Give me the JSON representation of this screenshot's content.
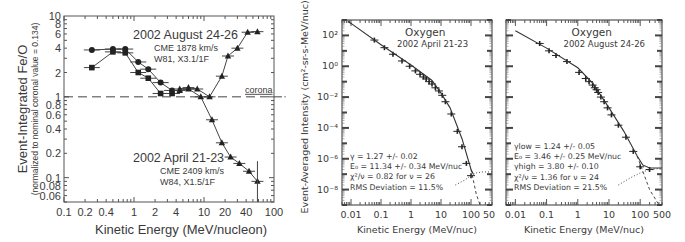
{
  "chart_data": [
    {
      "type": "line",
      "title": "",
      "xlabel": "Kinetic Energy (MeV/nucleon)",
      "ylabel": "Event-Integrated Fe/O",
      "ylabel_sub": "(normalized to nominal coronal value = 0.134)",
      "xscale": "log",
      "yscale": "log",
      "xlim": [
        0.1,
        100
      ],
      "ylim": [
        0.05,
        10
      ],
      "xticks": [
        "0.1",
        "0.2",
        "0.4",
        "1",
        "2",
        "4",
        "10",
        "20",
        "40",
        "100"
      ],
      "xtick_values": [
        0.1,
        0.2,
        0.4,
        1,
        2,
        4,
        10,
        20,
        40,
        100
      ],
      "yticks": [
        "10",
        "8",
        "6",
        "4",
        "2",
        "1",
        "0.8",
        "0.6",
        "0.4",
        "0.2",
        "0.1",
        "0.08",
        "0.06"
      ],
      "ytick_values": [
        10,
        8,
        6,
        4,
        2,
        1,
        0.8,
        0.6,
        0.4,
        0.2,
        0.1,
        0.08,
        0.06
      ],
      "reference_line": {
        "y": 1,
        "label": "corona",
        "style": "dashed"
      },
      "annotations": [
        {
          "title": "2002 August 24-26",
          "lines": [
            "CME 1878 km/s",
            "W81, X3.1/1F"
          ]
        },
        {
          "title": "2002 April 21-23",
          "lines": [
            "CME 2409 km/s",
            "W84, X1.5/1F"
          ]
        }
      ],
      "series": [
        {
          "name": "2002 August 24-26 (circles/squares, low E)",
          "marker": "circle",
          "x": [
            0.25,
            0.5,
            0.75,
            1.15,
            1.6,
            2.4,
            3.5
          ],
          "y": [
            3.8,
            3.9,
            3.9,
            2.7,
            2.2,
            1.5,
            1.2
          ]
        },
        {
          "name": "2002 April 21-23 (squares, low E)",
          "marker": "square",
          "x": [
            0.25,
            0.5,
            0.75,
            1.15,
            1.6,
            2.4,
            3.5
          ],
          "y": [
            2.3,
            3.6,
            3.5,
            2.0,
            1.7,
            1.1,
            1.1
          ]
        },
        {
          "name": "2002 August 24-26 (triangles, high E)",
          "marker": "triangle",
          "x": [
            4.5,
            6,
            8,
            12,
            18,
            22,
            30,
            42,
            58
          ],
          "y": [
            1.25,
            1.3,
            1.25,
            1.0,
            1.8,
            3.2,
            4.0,
            6.3,
            6.4
          ]
        },
        {
          "name": "2002 April 21-23 (triangles, high E)",
          "marker": "triangle",
          "x": [
            4.5,
            6,
            9,
            13,
            18,
            24,
            32,
            44,
            58
          ],
          "y": [
            1.2,
            1.25,
            1.0,
            0.52,
            0.27,
            0.18,
            0.15,
            0.12,
            0.09
          ]
        }
      ]
    },
    {
      "type": "line",
      "title": "Oxygen",
      "subtitle": "2002 April 21-23",
      "xlabel": "Kinetic Energy (MeV/nuc)",
      "ylabel": "Event-Averaged Intensity (cm²-sr-s-MeV/nuc)⁻¹",
      "xscale": "log",
      "yscale": "log",
      "xlim": [
        0.005,
        500
      ],
      "ylim": [
        1e-09,
        1000.0
      ],
      "xticks": [
        "0.01",
        "0.1",
        "1",
        "10",
        "100",
        "500"
      ],
      "xtick_values": [
        0.01,
        0.1,
        1,
        10,
        100,
        500
      ],
      "yticks": [
        "10²",
        "10⁰",
        "10⁻²",
        "10⁻⁴",
        "10⁻⁶",
        "10⁻⁸"
      ],
      "ytick_exps": [
        2,
        0,
        -2,
        -4,
        -6,
        -8
      ],
      "fit_text": [
        "γ = 1.27 +/- 0.02",
        "E₀ = 11.34 +/- 0.34 MeV/nuc",
        "χ²/ν = 0.82 for ν = 26",
        "RMS Deviation = 11.5%"
      ],
      "series": [
        {
          "name": "data",
          "marker": "plus",
          "x": [
            0.06,
            0.13,
            0.25,
            0.5,
            0.9,
            1.4,
            2,
            2.6,
            3.2,
            4,
            5,
            6.5,
            8.5,
            11,
            14,
            22,
            35,
            50,
            70,
            100
          ],
          "y": [
            50.0,
            16.0,
            6,
            2.2,
            1,
            0.5,
            0.3,
            0.2,
            0.15,
            0.1,
            0.07,
            0.04,
            0.025,
            0.013,
            0.005,
            0.0008,
            6e-05,
            6e-06,
            5e-07,
            8e-08
          ]
        },
        {
          "name": "fit",
          "style": "solid",
          "x": [
            0.008,
            0.01,
            0.1,
            1,
            5,
            10,
            20,
            50,
            100,
            120
          ],
          "y": [
            800,
            600,
            25,
            1.2,
            0.12,
            0.018,
            0.002,
            2e-05,
            2e-07,
            1e-07
          ]
        },
        {
          "name": "background",
          "style": "dotted",
          "x": [
            30,
            60,
            100,
            150,
            250,
            500
          ],
          "y": [
            2e-08,
            4e-08,
            8e-08,
            1.2e-07,
            1.4e-07,
            1.4e-07
          ]
        },
        {
          "name": "fit-extrapolation",
          "style": "dashed",
          "x": [
            100,
            150,
            200
          ],
          "y": [
            2e-07,
            5e-09,
            1e-09
          ]
        }
      ]
    },
    {
      "type": "line",
      "title": "Oxygen",
      "subtitle": "2002 August 24-26",
      "xlabel": "Kinetic Energy (MeV/nuc)",
      "ylabel": "",
      "xscale": "log",
      "yscale": "log",
      "xlim": [
        0.005,
        500
      ],
      "ylim": [
        1e-09,
        1000.0
      ],
      "xticks": [
        "0.01",
        "0.1",
        "1",
        "10",
        "100",
        "500"
      ],
      "xtick_values": [
        0.01,
        0.1,
        1,
        10,
        100,
        500
      ],
      "fit_text": [
        "γlow = 1.24 +/- 0.05",
        "E₀ = 3.46 +/- 0.25 MeV/nuc",
        "γhigh = 3.80 +/- 0.10",
        "χ²/ν = 1.36 for ν = 24",
        "RMS Deviation = 21.5%"
      ],
      "series": [
        {
          "name": "data",
          "marker": "plus",
          "x": [
            0.06,
            0.12,
            0.2,
            0.45,
            1.1,
            1.8,
            2.3,
            3,
            3.5,
            4,
            4.5,
            5.5,
            7,
            9,
            12,
            20,
            35,
            60,
            100,
            200
          ],
          "y": [
            30.0,
            10.0,
            5,
            2,
            0.4,
            0.16,
            0.1,
            0.06,
            0.04,
            0.03,
            0.02,
            0.01,
            0.005,
            0.002,
            0.0007,
            0.00015,
            2.5e-05,
            3e-06,
            3e-07,
            2e-07
          ]
        },
        {
          "name": "fit",
          "style": "solid",
          "x": [
            0.01,
            0.1,
            1,
            3,
            10,
            30,
            80,
            120,
            200,
            500
          ],
          "y": [
            200,
            15,
            0.8,
            0.08,
            0.002,
            6e-05,
            1.5e-06,
            4e-07,
            2.5e-07,
            2.5e-07
          ]
        },
        {
          "name": "background",
          "style": "dotted",
          "x": [
            20,
            50,
            100,
            200,
            500
          ],
          "y": [
            2e-08,
            6e-08,
            1.2e-07,
            2e-07,
            2.4e-07
          ]
        },
        {
          "name": "fit-extrapolation",
          "style": "dashed",
          "x": [
            80,
            200,
            400
          ],
          "y": [
            1.5e-06,
            1e-08,
            1e-09
          ]
        }
      ]
    }
  ]
}
